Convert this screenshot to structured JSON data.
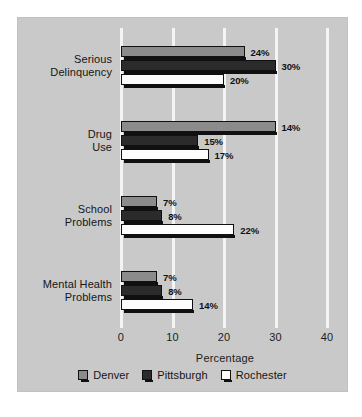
{
  "chart_data": {
    "type": "bar",
    "orientation": "horizontal",
    "grouped": true,
    "title": "",
    "xlabel": "Percentage",
    "ylabel": "",
    "xlim": [
      0,
      40
    ],
    "xticks": [
      0,
      10,
      20,
      30,
      40
    ],
    "xtick_labels": [
      "0",
      "10",
      "20",
      "30",
      "40"
    ],
    "grid": true,
    "grid_axis": "x",
    "legend_position": "bottom",
    "categories": [
      "Serious Delinquency",
      "Drug Use",
      "School Problems",
      "Mental Health Problems"
    ],
    "category_lines": [
      [
        "Serious",
        "Delinquency"
      ],
      [
        "Drug",
        "Use"
      ],
      [
        "School",
        "Problems"
      ],
      [
        "Mental Health",
        "Problems"
      ]
    ],
    "series": [
      {
        "name": "Denver",
        "color": "#8b8b8b",
        "values": [
          24,
          30,
          7,
          7
        ],
        "labels": [
          "24%",
          "",
          "7%",
          "7%"
        ]
      },
      {
        "name": "Pittsburgh",
        "color": "#2b2b2b",
        "values": [
          30,
          15,
          8,
          8
        ],
        "labels": [
          "30%",
          "15%",
          "8%",
          "8%"
        ]
      },
      {
        "name": "Rochester",
        "color": "#fdfdfd",
        "values": [
          20,
          17,
          22,
          14
        ],
        "labels": [
          "20%",
          "17%",
          "22%",
          "14%"
        ]
      }
    ],
    "data_by_category": [
      {
        "category": "Serious Delinquency",
        "Denver": 24,
        "Pittsburgh": 30,
        "Rochester": 20,
        "Denver_label": "24%",
        "Pittsburgh_label": "30%",
        "Rochester_label": "20%"
      },
      {
        "category": "Drug Use",
        "Denver": 14,
        "Pittsburgh": 15,
        "Rochester": 17,
        "Denver_label": "14%",
        "Pittsburgh_label": "15%",
        "Rochester_label": "17%"
      },
      {
        "category": "School Problems",
        "Denver": 7,
        "Pittsburgh": 8,
        "Rochester": 22,
        "Denver_label": "7%",
        "Pittsburgh_label": "8%",
        "Rochester_label": "22%"
      },
      {
        "category": "Mental Health Problems",
        "Denver": 7,
        "Pittsburgh": 8,
        "Rochester": 14,
        "Denver_label": "7%",
        "Pittsburgh_label": "8%",
        "Rochester_label": "14%"
      }
    ]
  },
  "legend": {
    "items": [
      {
        "label": "Denver",
        "color": "#8b8b8b"
      },
      {
        "label": "Pittsburgh",
        "color": "#2b2b2b"
      },
      {
        "label": "Rochester",
        "color": "#fdfdfd"
      }
    ]
  },
  "axis": {
    "title": "Percentage",
    "ticks": [
      "0",
      "10",
      "20",
      "30",
      "40"
    ]
  },
  "colors": {
    "panel_background": "#c9c9c9",
    "page_background": "#ffffff",
    "gridline": "#f4f4f4",
    "bar_outline": "#101010",
    "text": "#151515"
  }
}
